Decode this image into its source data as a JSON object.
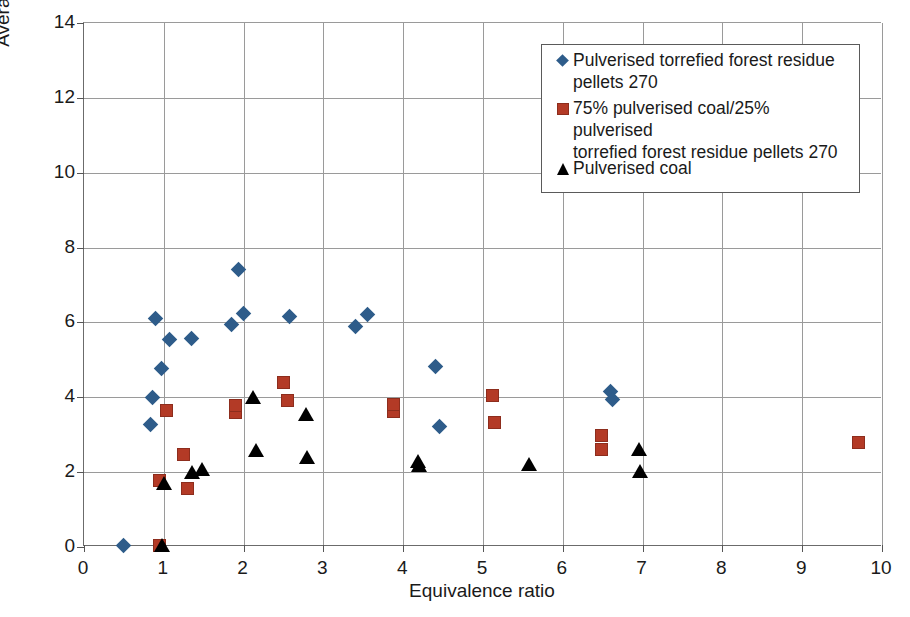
{
  "chart_data": {
    "type": "scatter",
    "title": "",
    "xlabel": "Equivalence ratio",
    "ylabel": "Average velocity (m/s)",
    "xlim": [
      0,
      10
    ],
    "ylim": [
      0,
      14
    ],
    "xticks": [
      0,
      1,
      2,
      3,
      4,
      5,
      6,
      7,
      8,
      9,
      10
    ],
    "yticks": [
      0,
      2,
      4,
      6,
      8,
      10,
      12,
      14
    ],
    "grid": true,
    "legend_position": "top-right",
    "series": [
      {
        "name": "Pulverised torrefied forest residue pellets 270",
        "marker": "diamond",
        "color": "#2E5C8A",
        "points": [
          [
            0.5,
            0.05
          ],
          [
            0.83,
            3.28
          ],
          [
            0.86,
            4.0
          ],
          [
            0.9,
            6.1
          ],
          [
            0.97,
            4.78
          ],
          [
            1.07,
            5.55
          ],
          [
            1.35,
            5.58
          ],
          [
            1.85,
            5.95
          ],
          [
            1.93,
            7.42
          ],
          [
            2.0,
            6.25
          ],
          [
            2.57,
            6.15
          ],
          [
            3.4,
            5.88
          ],
          [
            3.55,
            6.2
          ],
          [
            4.4,
            4.82
          ],
          [
            4.45,
            3.22
          ],
          [
            6.6,
            4.15
          ],
          [
            6.62,
            3.95
          ]
        ]
      },
      {
        "name": "75% pulverised coal/25% pulverised torrefied forest residue pellets 270",
        "marker": "square",
        "color": "#B33A26",
        "points": [
          [
            0.95,
            0.05
          ],
          [
            0.95,
            1.78
          ],
          [
            1.03,
            3.65
          ],
          [
            1.25,
            2.48
          ],
          [
            1.3,
            1.55
          ],
          [
            1.9,
            3.6
          ],
          [
            1.9,
            3.78
          ],
          [
            2.5,
            4.4
          ],
          [
            2.55,
            3.92
          ],
          [
            3.88,
            3.62
          ],
          [
            3.88,
            3.8
          ],
          [
            5.12,
            4.05
          ],
          [
            5.15,
            3.32
          ],
          [
            6.48,
            2.98
          ],
          [
            6.48,
            2.6
          ],
          [
            9.7,
            2.78
          ]
        ]
      },
      {
        "name": "Pulverised coal",
        "marker": "triangle",
        "color": "#000000",
        "points": [
          [
            0.98,
            0.05
          ],
          [
            1.0,
            1.72
          ],
          [
            1.35,
            2.0
          ],
          [
            1.48,
            2.08
          ],
          [
            2.12,
            4.0
          ],
          [
            2.15,
            2.58
          ],
          [
            2.78,
            3.55
          ],
          [
            2.8,
            2.4
          ],
          [
            4.18,
            2.3
          ],
          [
            4.2,
            2.2
          ],
          [
            5.58,
            2.22
          ],
          [
            6.95,
            2.62
          ],
          [
            6.97,
            2.02
          ]
        ]
      }
    ]
  },
  "legend": {
    "entries": [
      {
        "marker": "diamond",
        "line1": "Pulverised torrefied forest residue",
        "line2": "pellets 270"
      },
      {
        "marker": "square",
        "line1": "75% pulverised coal/25% pulverised",
        "line2": "torrefied forest residue pellets 270"
      },
      {
        "marker": "triangle",
        "line1": "Pulverised coal",
        "line2": ""
      }
    ]
  },
  "axes": {
    "x_title": "Equivalence ratio",
    "y_title": "Average velocity (m/s)",
    "x_tick_labels": [
      "0",
      "1",
      "2",
      "3",
      "4",
      "5",
      "6",
      "7",
      "8",
      "9",
      "10"
    ],
    "y_tick_labels": [
      "0",
      "2",
      "4",
      "6",
      "8",
      "10",
      "12",
      "14"
    ]
  }
}
